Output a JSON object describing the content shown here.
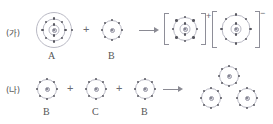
{
  "figure": {
    "type": "electron-shell-bonding-diagram",
    "rows": [
      {
        "id": "ga",
        "label": "(가)",
        "reaction_type": "ionic",
        "reactants": [
          {
            "symbol": "A",
            "shells": [
              2,
              8,
              1
            ],
            "shell_radii": [
              5.5,
              11.5,
              17.5
            ],
            "name": "atom-a"
          },
          {
            "symbol": "B",
            "shells": [
              8
            ],
            "shell_radii": [
              10
            ],
            "name": "atom-b"
          }
        ],
        "operators": [
          "+"
        ],
        "arrow": "→",
        "products": [
          {
            "symbol": "",
            "shells": [
              2,
              8
            ],
            "shell_radii": [
              5.5,
              11.5
            ],
            "charge": "+",
            "bracketed": true,
            "name": "cation-a"
          },
          {
            "symbol": "",
            "shells": [
              2,
              8
            ],
            "shell_radii": [
              5.5,
              13
            ],
            "charge": "−",
            "bracketed": true,
            "name": "anion-b"
          }
        ]
      },
      {
        "id": "na",
        "label": "(나)",
        "reaction_type": "covalent",
        "reactants": [
          {
            "symbol": "B",
            "shells": [
              8
            ],
            "shell_radii": [
              10
            ],
            "name": "atom-b-1"
          },
          {
            "symbol": "C",
            "shells": [
              8
            ],
            "shell_radii": [
              10
            ],
            "name": "atom-c"
          },
          {
            "symbol": "B",
            "shells": [
              8
            ],
            "shell_radii": [
              10
            ],
            "name": "atom-b-2"
          }
        ],
        "operators": [
          "+",
          "+"
        ],
        "arrow": "→",
        "products": [
          {
            "symbol": "",
            "shells": [
              8
            ],
            "shell_radii": [
              10
            ],
            "name": "molecule-atom-top"
          },
          {
            "symbol": "",
            "shells": [
              8
            ],
            "shell_radii": [
              10
            ],
            "name": "molecule-atom-left"
          },
          {
            "symbol": "",
            "shells": [
              8
            ],
            "shell_radii": [
              10
            ],
            "name": "molecule-atom-right"
          }
        ]
      }
    ],
    "colors": {
      "shell_stroke": "#b9b9c4",
      "electron": "#57575f",
      "nucleus_fill": "#d9d9e0",
      "text": "#555555",
      "arrow": "#8a8a93",
      "bracket": "#8e8e98",
      "background": "#ffffff"
    }
  }
}
